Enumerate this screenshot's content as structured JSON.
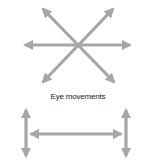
{
  "diagram": {
    "label": "Eye movements",
    "arrow_color": "#a6a6a6",
    "top_figure": "eight-direction arrows (horizontal and two diagonals)",
    "bottom_figure": "horizontal double arrow connecting two vertical double arrows"
  }
}
